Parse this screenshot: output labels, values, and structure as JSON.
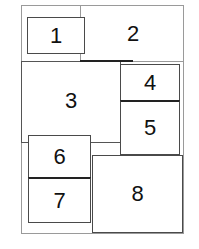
{
  "diagram": {
    "type": "numbered-layout-regions",
    "colors": {
      "border": "#4a4a4a",
      "frame": "#9a9a9a",
      "text": "#111111",
      "background": "#ffffff"
    },
    "regions": [
      {
        "id": 1,
        "label": "1"
      },
      {
        "id": 2,
        "label": "2"
      },
      {
        "id": 3,
        "label": "3"
      },
      {
        "id": 4,
        "label": "4"
      },
      {
        "id": 5,
        "label": "5"
      },
      {
        "id": 6,
        "label": "6"
      },
      {
        "id": 7,
        "label": "7"
      },
      {
        "id": 8,
        "label": "8"
      }
    ]
  }
}
